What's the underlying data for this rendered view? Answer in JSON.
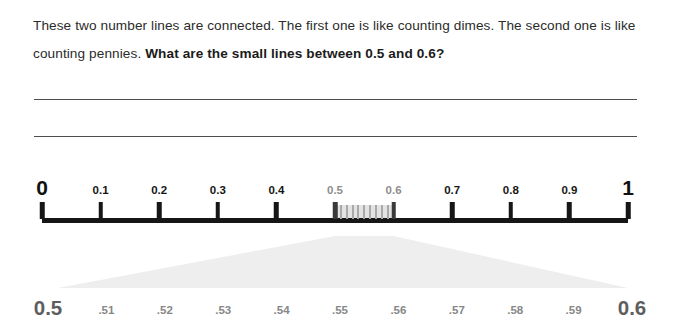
{
  "prompt": {
    "sentence_1": "These two number lines are connected. The first one is like counting dimes. The second one is like counting pennies. ",
    "question": "What are the small lines between 0.5 and 0.6?"
  },
  "answer_lines": {
    "line_1": "",
    "line_2": ""
  },
  "chart_data": {
    "type": "number-line",
    "title": "",
    "top_line": {
      "label": "tenths number line",
      "min": 0,
      "max": 1,
      "step": 0.1,
      "ticks": [
        {
          "value": 0,
          "label": "0",
          "style": "endpoint",
          "color": "#111111"
        },
        {
          "value": 0.1,
          "label": "0.1",
          "style": "major",
          "color": "#161616"
        },
        {
          "value": 0.2,
          "label": "0.2",
          "style": "major",
          "color": "#161616"
        },
        {
          "value": 0.3,
          "label": "0.3",
          "style": "major",
          "color": "#161616"
        },
        {
          "value": 0.4,
          "label": "0.4",
          "style": "major",
          "color": "#161616"
        },
        {
          "value": 0.5,
          "label": "0.5",
          "style": "zone-edge",
          "color": "#8e8e8e"
        },
        {
          "value": 0.6,
          "label": "0.6",
          "style": "zone-edge",
          "color": "#8e8e8e"
        },
        {
          "value": 0.7,
          "label": "0.7",
          "style": "major",
          "color": "#161616"
        },
        {
          "value": 0.8,
          "label": "0.8",
          "style": "major",
          "color": "#161616"
        },
        {
          "value": 0.9,
          "label": "0.9",
          "style": "major",
          "color": "#161616"
        },
        {
          "value": 1,
          "label": "1",
          "style": "endpoint",
          "color": "#111111"
        }
      ],
      "highlight_zone": {
        "from": 0.5,
        "to": 0.6,
        "minor_ticks": 9,
        "fill": "#e3e3e3",
        "tick_color": "#a9a9a9"
      }
    },
    "bottom_line": {
      "label": "hundredths number line (zoom of 0.5 to 0.6)",
      "min": 0.5,
      "max": 0.6,
      "step": 0.01,
      "ticks": [
        {
          "value": 0.5,
          "label": "0.5",
          "style": "endpoint",
          "color": "#5e5e5e"
        },
        {
          "value": 0.51,
          "label": ".51",
          "style": "minor",
          "color": "#878787"
        },
        {
          "value": 0.52,
          "label": ".52",
          "style": "minor",
          "color": "#878787"
        },
        {
          "value": 0.53,
          "label": ".53",
          "style": "minor",
          "color": "#878787"
        },
        {
          "value": 0.54,
          "label": ".54",
          "style": "minor",
          "color": "#878787"
        },
        {
          "value": 0.55,
          "label": ".55",
          "style": "minor",
          "color": "#878787"
        },
        {
          "value": 0.56,
          "label": ".56",
          "style": "minor",
          "color": "#878787"
        },
        {
          "value": 0.57,
          "label": ".57",
          "style": "minor",
          "color": "#878787"
        },
        {
          "value": 0.58,
          "label": ".58",
          "style": "minor",
          "color": "#878787"
        },
        {
          "value": 0.59,
          "label": ".59",
          "style": "minor",
          "color": "#878787"
        },
        {
          "value": 0.6,
          "label": "0.6",
          "style": "endpoint",
          "color": "#5e5e5e"
        }
      ]
    },
    "funnel": {
      "label": "zoom-expander",
      "fill": "#eeeeee",
      "top_from": 0.5,
      "top_to": 0.6
    }
  }
}
